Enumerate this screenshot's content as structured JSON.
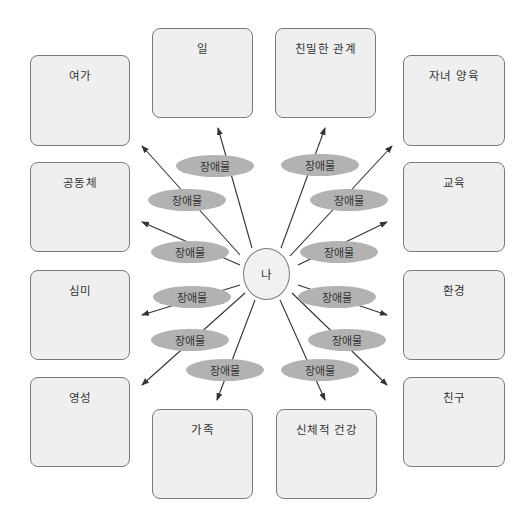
{
  "center": {
    "label": "나"
  },
  "domains": [
    {
      "id": "work",
      "label": "일"
    },
    {
      "id": "intimate-relations",
      "label": "친밀한 관계"
    },
    {
      "id": "leisure",
      "label": "여가"
    },
    {
      "id": "parenting",
      "label": "자녀 양육"
    },
    {
      "id": "community",
      "label": "공동체"
    },
    {
      "id": "education",
      "label": "교육"
    },
    {
      "id": "aesthetics",
      "label": "심미"
    },
    {
      "id": "environment",
      "label": "환경"
    },
    {
      "id": "spirituality",
      "label": "영성"
    },
    {
      "id": "friends",
      "label": "친구"
    },
    {
      "id": "family",
      "label": "가족"
    },
    {
      "id": "physical-health",
      "label": "신체적 건강"
    }
  ],
  "obstacle_label": "장애물",
  "colors": {
    "box_fill": "#efefef",
    "box_border": "#7a7a7a",
    "obstacle_fill": "#b2b2b2",
    "arrow": "#333333",
    "text": "#333333"
  }
}
